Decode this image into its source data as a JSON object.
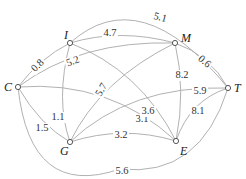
{
  "graph": {
    "nodes": [
      {
        "id": "C",
        "label": "C",
        "x": 18,
        "y": 87,
        "lx": 4,
        "ly": 91
      },
      {
        "id": "I",
        "label": "I",
        "x": 70,
        "y": 43,
        "lx": 64,
        "ly": 39
      },
      {
        "id": "M",
        "label": "M",
        "x": 175,
        "y": 43,
        "lx": 181,
        "ly": 42
      },
      {
        "id": "T",
        "label": "T",
        "x": 228,
        "y": 88,
        "lx": 234,
        "ly": 92
      },
      {
        "id": "G",
        "label": "G",
        "x": 70,
        "y": 142,
        "lx": 60,
        "ly": 155
      },
      {
        "id": "E",
        "label": "E",
        "x": 176,
        "y": 141,
        "lx": 180,
        "ly": 155
      }
    ],
    "edges": [
      {
        "from": "C",
        "to": "I",
        "weight": "0.8",
        "path": "M18,87 Q40,58 70,43",
        "lx": 38,
        "ly": 66,
        "rot": -45
      },
      {
        "from": "C",
        "to": "M",
        "weight": "5.2",
        "path": "M18,87 Q80,40 175,43",
        "lx": 73,
        "ly": 62,
        "rot": -20
      },
      {
        "from": "C",
        "to": "E",
        "weight": "3.1",
        "path": "M18,87 Q110,80 176,141",
        "lx": 142,
        "ly": 120,
        "rot": 0
      },
      {
        "from": "C",
        "to": "G",
        "weight": "1.5",
        "path": "M18,87 Q40,125 70,142",
        "lx": 42,
        "ly": 129,
        "rot": 0
      },
      {
        "from": "C",
        "to": "T",
        "weight": "5.6",
        "path": "M18,87 Q30,200 120,169 Q200,178 228,88",
        "lx": 122,
        "ly": 172,
        "rot": 0
      },
      {
        "from": "I",
        "to": "M",
        "weight": "4.7",
        "path": "M70,43 Q120,28 175,43",
        "lx": 110,
        "ly": 34,
        "rot": 0
      },
      {
        "from": "I",
        "to": "T",
        "weight": "5.1",
        "path": "M70,43 Q140,-20 228,88",
        "lx": 160,
        "ly": 18,
        "rot": 15
      },
      {
        "from": "I",
        "to": "E",
        "weight": "3.6",
        "path": "M70,43 Q140,70 176,141",
        "lx": 148,
        "ly": 112,
        "rot": 0
      },
      {
        "from": "I",
        "to": "G",
        "weight": "1.1",
        "path": "M70,43 Q55,100 70,142",
        "lx": 58,
        "ly": 118,
        "rot": 0
      },
      {
        "from": "M",
        "to": "T",
        "weight": "0.6",
        "path": "M175,43 Q210,55 228,88",
        "lx": 204,
        "ly": 62,
        "rot": 40
      },
      {
        "from": "M",
        "to": "E",
        "weight": "8.2",
        "path": "M175,43 Q186,90 176,141",
        "lx": 182,
        "ly": 76,
        "rot": 0
      },
      {
        "from": "M",
        "to": "G",
        "weight": "5.7",
        "path": "M175,43 Q100,80 70,142",
        "lx": 102,
        "ly": 90,
        "rot": -60
      },
      {
        "from": "G",
        "to": "T",
        "weight": "5.9",
        "path": "M70,142 Q130,85 228,88",
        "lx": 200,
        "ly": 92,
        "rot": 0
      },
      {
        "from": "G",
        "to": "E",
        "weight": "3.2",
        "path": "M70,142 Q123,125 176,141",
        "lx": 121,
        "ly": 136,
        "rot": 0
      },
      {
        "from": "T",
        "to": "E",
        "weight": "8.1",
        "path": "M228,88 Q190,100 176,141",
        "lx": 198,
        "ly": 112,
        "rot": 0
      }
    ]
  }
}
